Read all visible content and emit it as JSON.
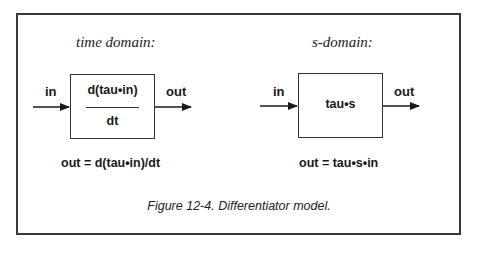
{
  "figure": {
    "caption": "Figure 12-4.  Differentiator model."
  },
  "time_domain": {
    "heading": "time domain:",
    "input_label": "in",
    "output_label": "out",
    "block_numerator": "d(tau•in)",
    "block_denominator": "dt",
    "equation": "out = d(tau•in)/dt"
  },
  "s_domain": {
    "heading": "s-domain:",
    "input_label": "in",
    "output_label": "out",
    "block_label": "tau•s",
    "equation": "out = tau•s•in"
  }
}
